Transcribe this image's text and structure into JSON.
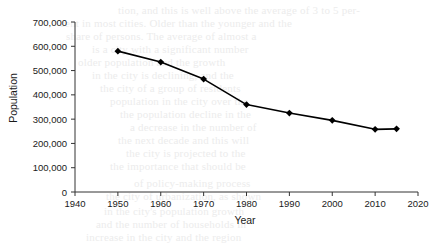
{
  "chart_data": {
    "type": "line",
    "title": "",
    "xlabel": "Year",
    "ylabel": "Population",
    "x": [
      1950,
      1960,
      1970,
      1980,
      1990,
      2000,
      2010,
      2015
    ],
    "values": [
      580000,
      535000,
      465000,
      360000,
      325000,
      295000,
      258000,
      260000
    ],
    "series": [
      {
        "name": "Population",
        "values": [
          580000,
          535000,
          465000,
          360000,
          325000,
          295000,
          258000,
          260000
        ]
      }
    ],
    "xlim": [
      1940,
      2020
    ],
    "ylim": [
      0,
      700000
    ],
    "xticks": [
      1940,
      1950,
      1960,
      1970,
      1980,
      1990,
      2000,
      2010,
      2020
    ],
    "xticklabels": [
      "1940",
      "1950",
      "1960",
      "1970",
      "1980",
      "1990",
      "2000",
      "2010",
      "2020"
    ],
    "yticks": [
      0,
      100000,
      200000,
      300000,
      400000,
      500000,
      600000,
      700000
    ],
    "yticklabels": [
      "0",
      "100,000",
      "200,000",
      "300,000",
      "400,000",
      "500,000",
      "600,000",
      "700,000"
    ],
    "grid": false,
    "legend": false,
    "marker": "diamond",
    "line_color": "#000000",
    "marker_color": "#000000",
    "axis_color": "#000000",
    "background": "#ffffff"
  },
  "axes": {
    "x_title": "Year",
    "y_title": "Population"
  },
  "bleed_lines": [
    {
      "text": "tion, and this is well above the average of 3 to 5 per-",
      "x": 118,
      "y": 4
    },
    {
      "text": "cent in most cities. Older than the younger and the",
      "x": 60,
      "y": 17
    },
    {
      "text": "share of persons. The average of almost a",
      "x": 66,
      "y": 30
    },
    {
      "text": "is a city with a significant number",
      "x": 92,
      "y": 43
    },
    {
      "text": "older population and the growth",
      "x": 78,
      "y": 56
    },
    {
      "text": "in the city is declining, and the",
      "x": 92,
      "y": 69
    },
    {
      "text": "the city of a group of residents",
      "x": 100,
      "y": 82
    },
    {
      "text": "population in the city over the",
      "x": 110,
      "y": 95
    },
    {
      "text": "the population decline in the",
      "x": 120,
      "y": 108
    },
    {
      "text": "a decrease in the number of",
      "x": 130,
      "y": 121
    },
    {
      "text": "the next decade and this will",
      "x": 118,
      "y": 134
    },
    {
      "text": "the city is projected to the",
      "x": 126,
      "y": 147
    },
    {
      "text": "the importance that should be",
      "x": 110,
      "y": 160
    },
    {
      "text": "of policy-making process",
      "x": 134,
      "y": 177
    },
    {
      "text": "the city of urbanization, as shown",
      "x": 106,
      "y": 190
    },
    {
      "text": "in the city's population growth",
      "x": 104,
      "y": 205
    },
    {
      "text": "and the number of households in",
      "x": 96,
      "y": 218
    },
    {
      "text": "increase in the city and the region",
      "x": 86,
      "y": 231
    }
  ]
}
